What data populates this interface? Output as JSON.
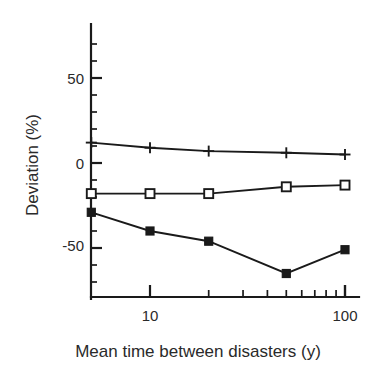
{
  "chart_data": {
    "type": "line",
    "title": "",
    "subtitle": "",
    "xlabel": "Mean time between disasters (y)",
    "ylabel": "Deviation (%)",
    "xscale": "log",
    "yscale": "linear",
    "xlim": [
      5,
      110
    ],
    "ylim": [
      -80,
      65
    ],
    "grid": false,
    "legend": "none",
    "x_tick_labels": [
      "10",
      "100"
    ],
    "x_tick_values": [
      10,
      100
    ],
    "y_tick_labels": [
      "50",
      "0",
      "-50"
    ],
    "y_tick_values": [
      50,
      0,
      -50
    ],
    "x": [
      5,
      10,
      20,
      50,
      100
    ],
    "series": [
      {
        "name": "plus-series",
        "marker": "plus",
        "fill": "none",
        "values": [
          12,
          9,
          7,
          6,
          5
        ]
      },
      {
        "name": "open-square-series",
        "marker": "square",
        "fill": "open",
        "values": [
          -18,
          -18,
          -18,
          -14,
          -13
        ]
      },
      {
        "name": "filled-square-series",
        "marker": "square",
        "fill": "filled",
        "values": [
          -29,
          -40,
          -46,
          -65,
          -51
        ]
      }
    ],
    "colors": {
      "line": "#1a1a1a",
      "axis": "#1a1a1a",
      "text": "#2a2a2a",
      "background": "#ffffff"
    }
  },
  "axes": {
    "y_axis_label": "Deviation (%)",
    "x_axis_label": "Mean time between disasters (y)",
    "y_labels": {
      "top": "50",
      "middle": "0",
      "bottom": "-50"
    },
    "x_labels": {
      "left": "10",
      "right": "100"
    }
  }
}
